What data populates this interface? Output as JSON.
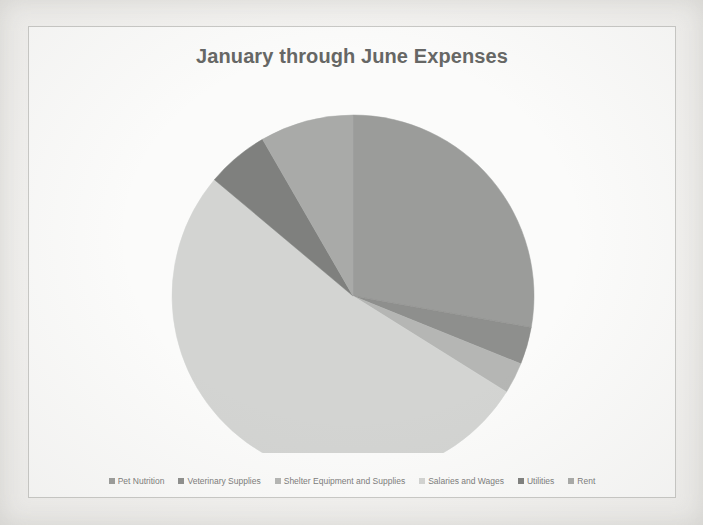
{
  "chart": {
    "title": "January through June Expenses",
    "title_color": "#666765",
    "background_color": "#fbfbfa",
    "border_color": "#c9c9c6"
  },
  "chart_data": {
    "type": "pie",
    "title": "January through June Expenses",
    "xlabel": "",
    "ylabel": "",
    "legend_position": "bottom",
    "grid": false,
    "start_angle_deg": 0,
    "direction": "clockwise",
    "categories": [
      "Pet Nutrition",
      "Veterinary Supplies",
      "Shelter Equipment and Supplies",
      "Salaries and Wages",
      "Utilities",
      "Rent"
    ],
    "values": [
      27.8,
      3.3,
      2.8,
      52.2,
      5.6,
      8.3
    ],
    "colors": [
      "#9b9c9a",
      "#8e8f8d",
      "#b5b6b4",
      "#d3d4d2",
      "#7f807e",
      "#a9aaa8"
    ],
    "slices": [
      {
        "label": "Pet Nutrition",
        "value": 27.8,
        "start_deg": 0.0,
        "end_deg": 100.0,
        "color": "#9b9c9a"
      },
      {
        "label": "Veterinary Supplies",
        "value": 3.3,
        "start_deg": 100.0,
        "end_deg": 112.0,
        "color": "#8e8f8d"
      },
      {
        "label": "Shelter Equipment and Supplies",
        "value": 2.8,
        "start_deg": 112.0,
        "end_deg": 122.0,
        "color": "#b5b6b4"
      },
      {
        "label": "Salaries and Wages",
        "value": 52.2,
        "start_deg": 122.0,
        "end_deg": 310.0,
        "color": "#d3d4d2"
      },
      {
        "label": "Utilities",
        "value": 5.6,
        "start_deg": 310.0,
        "end_deg": 330.0,
        "color": "#7f807e"
      },
      {
        "label": "Rent",
        "value": 8.3,
        "start_deg": 330.0,
        "end_deg": 360.0,
        "color": "#a9aaa8"
      }
    ]
  },
  "legend": {
    "items": [
      {
        "label": "Pet Nutrition",
        "color": "#9b9c9a"
      },
      {
        "label": "Veterinary Supplies",
        "color": "#8e8f8d"
      },
      {
        "label": "Shelter Equipment and Supplies",
        "color": "#b5b6b4"
      },
      {
        "label": "Salaries and Wages",
        "color": "#d3d4d2"
      },
      {
        "label": "Utilities",
        "color": "#7f807e"
      },
      {
        "label": "Rent",
        "color": "#a9aaa8"
      }
    ]
  }
}
